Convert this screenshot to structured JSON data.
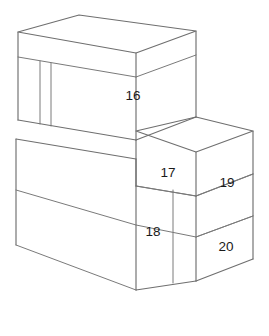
{
  "figure": {
    "kind": "isometric-block-diagram",
    "background_color": "#ffffff",
    "line_color": "#6f6f6f",
    "face_color": "#ffffff",
    "label_color": "#1a1a1a",
    "labels": [
      {
        "id": "16",
        "text": "16",
        "x": 133,
        "y": 96,
        "face": "front-upper-block"
      },
      {
        "id": "17",
        "text": "17",
        "x": 168,
        "y": 173,
        "face": "front-middle-block"
      },
      {
        "id": "18",
        "text": "18",
        "x": 153,
        "y": 232,
        "face": "front-lower-block"
      },
      {
        "id": "19",
        "text": "19",
        "x": 227,
        "y": 183,
        "face": "right-upper-block"
      },
      {
        "id": "20",
        "text": "20",
        "x": 226,
        "y": 247,
        "face": "right-lower-block"
      }
    ]
  }
}
